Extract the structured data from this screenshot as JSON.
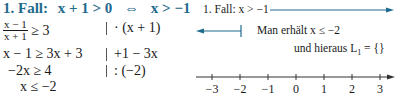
{
  "left": {
    "heading": {
      "case": "1. Fall:",
      "condition": "x + 1 > 0",
      "equiv_symbol": "⇔",
      "result": "x > −1",
      "color": "#1f6b8e"
    },
    "steps": [
      {
        "fraction": {
          "numerator": "x − 1",
          "denominator": "x + 1"
        },
        "rhs": "≥ 3",
        "operation": "· (x + 1)"
      },
      {
        "expr": "x − 1 ≥ 3x + 3",
        "operation": "+1 − 3x"
      },
      {
        "expr": "−2x ≥ 4",
        "operation": ": (−2)"
      },
      {
        "expr": "x ≤ −2",
        "operation": ""
      }
    ]
  },
  "right": {
    "case_label": "1. Fall: x > −1",
    "result_text": "Man erhält  x ≤ −2",
    "solution_text": "und hieraus L",
    "solution_sub": "1",
    "solution_rhs": " = {}",
    "number_line": {
      "ticks": [
        "−3",
        "−2",
        "−1",
        "0",
        "1",
        "2",
        "3"
      ]
    },
    "line_color": "#1f6b8e"
  }
}
